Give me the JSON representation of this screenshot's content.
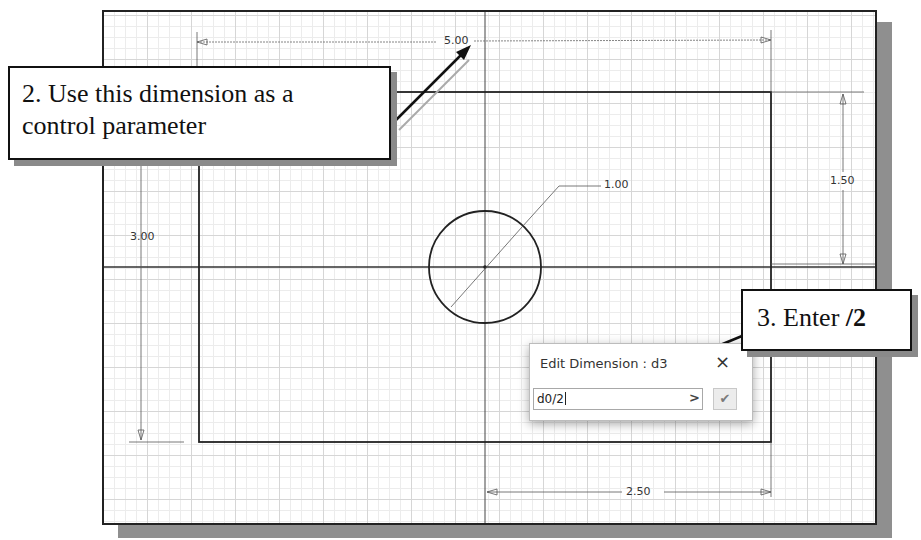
{
  "sketch": {
    "dimensions": {
      "width_overall": "5.00",
      "height_overall": "3.00",
      "circle_diameter": "1.00",
      "circle_vertical_offset": "1.50",
      "circle_horizontal_offset": "2.50"
    }
  },
  "callouts": {
    "step2": {
      "line1": "2. Use this dimension as a",
      "line2": "control parameter"
    },
    "step3": {
      "prefix": "3. Enter ",
      "bold": "/2"
    }
  },
  "edit_dimension_dialog": {
    "title": "Edit Dimension : d3",
    "close_icon": "×",
    "input_value": "d0/2",
    "more_icon": ">",
    "ok_icon": "✔"
  }
}
